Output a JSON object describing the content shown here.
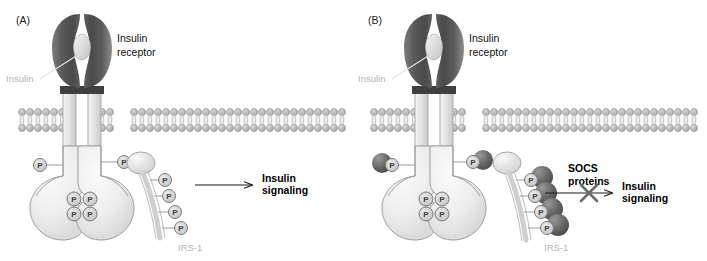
{
  "figure": {
    "background_color": "#ffffff",
    "panels": [
      {
        "id": "A",
        "label": "(A)",
        "labels": {
          "receptor": "Insulin receptor",
          "receptor_line1": "Insulin",
          "receptor_line2": "receptor",
          "insulin": "Insulin",
          "irs1": "IRS-1",
          "outcome_line1": "Insulin",
          "outcome_line2": "signaling"
        },
        "phospho_label": "P",
        "receptor_phosphates": 2,
        "kinase_phosphates": 4,
        "irs1_phosphates": 4,
        "socs_count": 0,
        "blocked": false
      },
      {
        "id": "B",
        "label": "(B)",
        "labels": {
          "receptor": "Insulin receptor",
          "receptor_line1": "Insulin",
          "receptor_line2": "receptor",
          "insulin": "Insulin",
          "irs1": "IRS-1",
          "socs_line1": "SOCS",
          "socs_line2": "proteins",
          "outcome_line1": "Insulin",
          "outcome_line2": "signaling"
        },
        "phospho_label": "P",
        "receptor_phosphates": 2,
        "kinase_phosphates": 4,
        "irs1_phosphates": 4,
        "socs_count": 6,
        "blocked": true,
        "block_marker": "X"
      }
    ],
    "colors": {
      "receptor_dark": "#4f4f4f",
      "receptor_mid": "#6e6e6e",
      "receptor_light": "#9a9a9a",
      "insulin_oval": "#dcdcdc",
      "membrane_head": "#b9b9b9",
      "membrane_tail": "#cfcfcf",
      "cytoplasmic_fill": "#ededed",
      "cytoplasmic_stroke": "#9d9d9d",
      "phosphate_fill": "#d5d5d5",
      "phosphate_stroke": "#7a7a7a",
      "irs1_ribbon": "#cfcfcf",
      "socs_dark": "#5d5d5d",
      "arrow": "#1a1a1a",
      "block_x": "#6b6b6b",
      "gray_text": "#b6b6b6",
      "dark_text": "#111111"
    }
  }
}
